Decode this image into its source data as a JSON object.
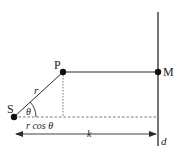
{
  "diagram": {
    "points": {
      "S": {
        "label": "S",
        "x": 14,
        "y": 117
      },
      "P": {
        "label": "P",
        "x": 63,
        "y": 72
      },
      "M": {
        "label": "M",
        "x": 158,
        "y": 72
      }
    },
    "labels": {
      "r": "r",
      "theta": "θ",
      "rcos": "r cos θ",
      "k": "k",
      "d": "d"
    },
    "colors": {
      "line": "#2a2a2a",
      "dashed": "#666666",
      "point": "#111111"
    }
  }
}
